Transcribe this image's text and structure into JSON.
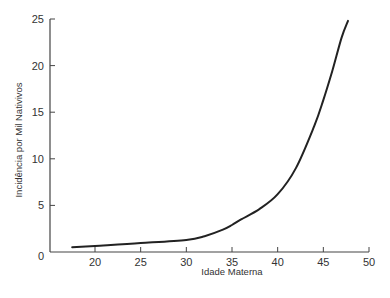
{
  "chart_data": {
    "type": "line",
    "title": "",
    "xlabel": "Idade Materna",
    "ylabel": "Incidência por Mil Nativivos",
    "xlim": [
      15,
      50
    ],
    "ylim": [
      0,
      25
    ],
    "xticks": [
      20,
      25,
      30,
      35,
      40,
      45,
      50
    ],
    "yticks": [
      0,
      5,
      10,
      15,
      20,
      25
    ],
    "grid": false,
    "legend": null,
    "series": [
      {
        "name": "Incidência",
        "color": "#222222",
        "x": [
          17.5,
          20,
          25,
          30,
          32,
          34,
          35,
          36,
          38,
          40,
          42,
          44,
          45,
          46,
          47,
          47.7
        ],
        "y": [
          0.5,
          0.65,
          0.95,
          1.3,
          1.7,
          2.4,
          2.9,
          3.5,
          4.6,
          6.2,
          9.0,
          13.5,
          16.3,
          19.5,
          23.0,
          24.8
        ]
      }
    ]
  }
}
